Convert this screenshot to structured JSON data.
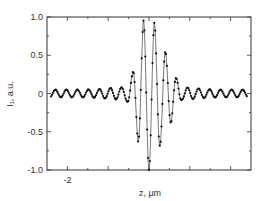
{
  "chart_data": {
    "type": "line",
    "title": "",
    "xlabel": "z, µm",
    "ylabel": "I₁, a.u.",
    "xlim": [
      -2.5,
      2.5
    ],
    "ylim": [
      -1.0,
      1.0
    ],
    "x_ticks": [
      -2,
      -1,
      0,
      1,
      2
    ],
    "x_tick_labels": [
      "-2",
      "",
      "",
      "",
      ""
    ],
    "y_ticks": [
      1.0,
      0.5,
      0,
      -0.5,
      -1.0
    ],
    "y_tick_labels": [
      "1.0",
      "0.5",
      "0",
      "-0.5",
      "-1.0"
    ],
    "grid": false,
    "legend": null,
    "series": [
      {
        "name": "I1",
        "style": "line with dot markers",
        "color": "#222222",
        "model": "I(z) = -A(z)·cos(2πz/0.27), Gaussian-like envelope centred at z≈0 with small residual ripple in tails",
        "carrier_period_um": 0.27,
        "peaks": [
          {
            "z": -0.67,
            "I": 0.08
          },
          {
            "z": -0.41,
            "I": 0.25
          },
          {
            "z": -0.14,
            "I": 0.95
          },
          {
            "z": 0.13,
            "I": 0.93
          },
          {
            "z": 0.4,
            "I": 0.55
          },
          {
            "z": 0.67,
            "I": 0.2
          }
        ],
        "troughs": [
          {
            "z": -0.54,
            "I": -0.1
          },
          {
            "z": -0.27,
            "I": -0.62
          },
          {
            "z": 0.0,
            "I": -1.0
          },
          {
            "z": 0.27,
            "I": -0.68
          },
          {
            "z": 0.54,
            "I": -0.38
          },
          {
            "z": 0.81,
            "I": -0.08
          }
        ],
        "tail_amplitude": 0.05
      }
    ]
  }
}
